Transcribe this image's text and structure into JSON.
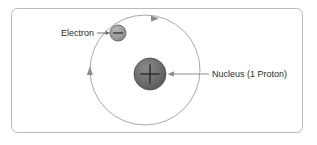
{
  "figure": {
    "frame": {
      "border_color": "#b9b9b9",
      "background_color": "#ffffff",
      "corner_radius": 6
    }
  },
  "labels": {
    "electron": "Electron",
    "nucleus": "Nucleus (1 Proton)"
  },
  "particles": {
    "electron": {
      "charge_symbol": "−",
      "fill_color": "#9a9a9a",
      "stroke_color": "#6e6e6e",
      "cx": 118,
      "cy": 33,
      "r": 8
    },
    "nucleus": {
      "charge_symbol": "+",
      "fill_color": "#6b6b6b",
      "stroke_color": "#4a4a4a",
      "cx": 150,
      "cy": 74,
      "r": 16
    }
  },
  "orbit": {
    "stroke_color": "#9e9e9e",
    "cx": 145,
    "cy": 70,
    "r": 55,
    "direction": "clockwise",
    "arrow_color": "#8c8c8c"
  },
  "leaders": {
    "electron_arrow_color": "#6e6e6e",
    "nucleus_arrow_color": "#8e8e8e"
  }
}
